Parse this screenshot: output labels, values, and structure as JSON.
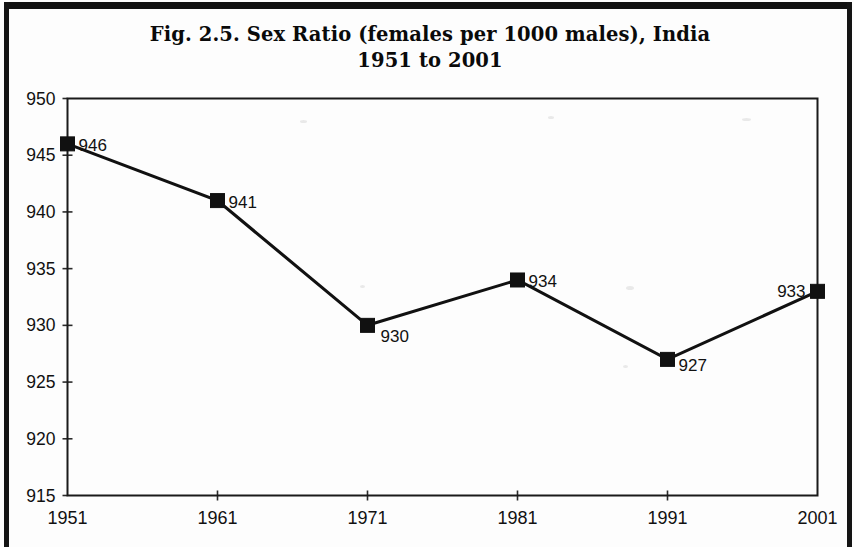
{
  "figure": {
    "title_line1": "Fig. 2.5. Sex Ratio (females per 1000 males), India",
    "title_line2": "1951 to 2001"
  },
  "chart_data": {
    "type": "line",
    "title": "Fig. 2.5. Sex Ratio (females per 1000 males), India 1951 to 2001",
    "xlabel": "",
    "ylabel": "",
    "categories": [
      "1951",
      "1961",
      "1971",
      "1981",
      "1991",
      "2001"
    ],
    "x": [
      1951,
      1961,
      1971,
      1981,
      1991,
      2001
    ],
    "values": [
      946,
      941,
      930,
      934,
      927,
      933
    ],
    "point_labels": [
      "946",
      "941",
      "930",
      "934",
      "927",
      "933"
    ],
    "point_label_side": [
      "right",
      "right",
      "right",
      "right",
      "right",
      "left"
    ],
    "ylim": [
      915,
      950
    ],
    "ytick_labels": [
      "950",
      "945",
      "940",
      "935",
      "930",
      "925",
      "920",
      "915"
    ],
    "ytick_values": [
      950,
      945,
      940,
      935,
      930,
      925,
      920,
      915
    ],
    "xtick_labels": [
      "1951",
      "1961",
      "1971",
      "1981",
      "1991",
      "2001"
    ],
    "grid": false,
    "legend": false,
    "marker": "square",
    "line_color": "#111111",
    "marker_color": "#111111",
    "axis_color": "#1a1a1a",
    "background_color": "#ffffff"
  }
}
